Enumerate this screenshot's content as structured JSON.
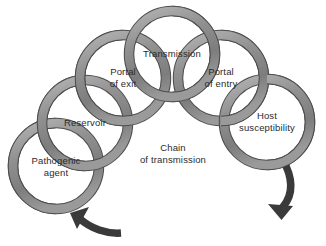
{
  "figure": {
    "title": "Chain of transmission",
    "center_label": "Chain\nof transmission",
    "background_color": "#ffffff",
    "ring_band_color": "#8c8c8c",
    "ring_outline_color": "#4d4d4d",
    "arrow_color": "#3a3a3a",
    "text_color": "#2b2b2b"
  },
  "rings": [
    {
      "id": "pathogenic-agent",
      "label": "Pathogenic\nagent",
      "cx": 56,
      "cy": 166,
      "r": 43,
      "order": 1
    },
    {
      "id": "reservoir",
      "label": "Reservoir",
      "cx": 85,
      "cy": 123,
      "r": 43,
      "order": 2
    },
    {
      "id": "portal-of-exit",
      "label": "Portal\nof exit",
      "cx": 123,
      "cy": 78,
      "r": 43,
      "order": 3
    },
    {
      "id": "transmission",
      "label": "Transmission",
      "cx": 172,
      "cy": 54,
      "r": 43,
      "order": 4
    },
    {
      "id": "portal-of-entry",
      "label": "Portal\nof entry",
      "cx": 221,
      "cy": 78,
      "r": 43,
      "order": 5
    },
    {
      "id": "host-susceptibility",
      "label": "Host\nsusceptibility",
      "cx": 267,
      "cy": 122,
      "r": 43,
      "order": 6
    }
  ],
  "arrows": [
    {
      "id": "arrow-right-descending",
      "direction": "down-left",
      "description": "curved arrow from host susceptibility sweeping down and left"
    },
    {
      "id": "arrow-bottom-ascending",
      "direction": "up-left",
      "description": "curved arrow from lower right sweeping up and left toward pathogenic agent"
    }
  ]
}
